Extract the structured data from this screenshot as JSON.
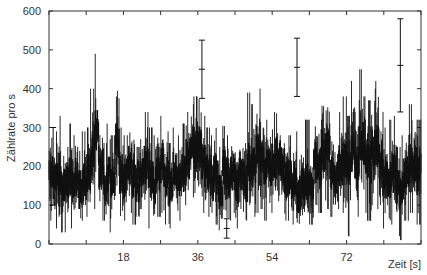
{
  "chart_data": {
    "type": "line",
    "title": "",
    "xlabel": "Zeit [s]",
    "ylabel": "Zählrate pro s",
    "xlim": [
      0,
      90
    ],
    "ylim": [
      0,
      600
    ],
    "xticks": [
      18,
      36,
      54,
      72
    ],
    "yticks": [
      0,
      100,
      200,
      300,
      400,
      500,
      600
    ],
    "grid": false,
    "legend": null,
    "line_color": "#111111",
    "series": [
      {
        "name": "Zählrate",
        "style": "vertical min/max bars per time bin (noisy count-rate trace)",
        "x": [
          0.5,
          1.5,
          2.5,
          3.5,
          4.5,
          5.5,
          6.5,
          7.5,
          8.5,
          9.5,
          10.5,
          11.5,
          12.5,
          13.5,
          14.5,
          15.5,
          16.5,
          17.5,
          18.5,
          19.5,
          20.5,
          21.5,
          22.5,
          23.5,
          24.5,
          25.5,
          26.5,
          27.5,
          28.5,
          29.5,
          30.5,
          31.5,
          32.5,
          33.5,
          34.5,
          35.5,
          36.5,
          37.5,
          38.5,
          39.5,
          40.5,
          41.5,
          42.5,
          43.5,
          44.5,
          45.5,
          46.5,
          47.5,
          48.5,
          49.5,
          50.5,
          51.5,
          52.5,
          53.5,
          54.5,
          55.5,
          56.5,
          57.5,
          58.5,
          59.5,
          60.5,
          61.5,
          62.5,
          63.5,
          64.5,
          65.5,
          66.5,
          67.5,
          68.5,
          69.5,
          70.5,
          71.5,
          72.5,
          73.5,
          74.5,
          75.5,
          76.5,
          77.5,
          78.5,
          79.5,
          80.5,
          81.5,
          82.5,
          83.5,
          84.5,
          85.5,
          86.5,
          87.5,
          88.5,
          89.5
        ],
        "low": [
          60,
          40,
          70,
          30,
          60,
          40,
          80,
          50,
          60,
          70,
          110,
          90,
          40,
          60,
          30,
          70,
          80,
          40,
          60,
          80,
          50,
          70,
          90,
          60,
          40,
          60,
          70,
          80,
          50,
          40,
          90,
          60,
          70,
          100,
          120,
          110,
          100,
          80,
          70,
          60,
          50,
          20,
          70,
          60,
          80,
          40,
          90,
          60,
          100,
          70,
          80,
          90,
          60,
          80,
          100,
          110,
          80,
          60,
          70,
          50,
          20,
          40,
          60,
          50,
          100,
          80,
          40,
          90,
          70,
          60,
          90,
          80,
          20,
          100,
          70,
          90,
          80,
          60,
          100,
          90,
          40,
          60,
          50,
          70,
          20,
          10,
          60,
          80,
          70,
          50
        ],
        "high": [
          320,
          290,
          330,
          300,
          250,
          310,
          280,
          240,
          290,
          300,
          400,
          490,
          320,
          260,
          310,
          280,
          460,
          300,
          280,
          320,
          300,
          250,
          270,
          340,
          300,
          280,
          310,
          330,
          290,
          260,
          300,
          280,
          310,
          340,
          360,
          380,
          420,
          330,
          300,
          280,
          330,
          250,
          380,
          280,
          300,
          270,
          310,
          260,
          390,
          360,
          380,
          400,
          320,
          330,
          340,
          360,
          300,
          300,
          280,
          290,
          220,
          260,
          320,
          290,
          360,
          320,
          410,
          430,
          300,
          290,
          340,
          380,
          330,
          420,
          340,
          450,
          380,
          370,
          400,
          420,
          340,
          300,
          320,
          330,
          250,
          280,
          340,
          360,
          350,
          320
        ],
        "center": [
          190,
          150,
          180,
          160,
          150,
          170,
          170,
          140,
          160,
          180,
          230,
          290,
          200,
          160,
          170,
          170,
          260,
          180,
          170,
          200,
          170,
          160,
          170,
          200,
          170,
          160,
          180,
          200,
          170,
          150,
          190,
          170,
          180,
          220,
          260,
          240,
          250,
          200,
          180,
          160,
          180,
          140,
          200,
          170,
          190,
          150,
          180,
          160,
          210,
          200,
          230,
          220,
          190,
          200,
          210,
          230,
          200,
          170,
          170,
          160,
          130,
          150,
          170,
          160,
          210,
          200,
          240,
          250,
          190,
          170,
          200,
          220,
          190,
          240,
          200,
          260,
          230,
          210,
          240,
          250,
          190,
          170,
          170,
          180,
          140,
          150,
          180,
          200,
          200,
          180
        ]
      }
    ],
    "error_bars": [
      {
        "x": 1.0,
        "y": 200,
        "low": 100,
        "high": 300
      },
      {
        "x": 37.0,
        "y": 450,
        "low": 375,
        "high": 525
      },
      {
        "x": 43.0,
        "y": 40,
        "low": 15,
        "high": 65
      },
      {
        "x": 60.0,
        "y": 455,
        "low": 380,
        "high": 530
      },
      {
        "x": 85.0,
        "y": 460,
        "low": 340,
        "high": 580
      }
    ],
    "annotations": []
  }
}
